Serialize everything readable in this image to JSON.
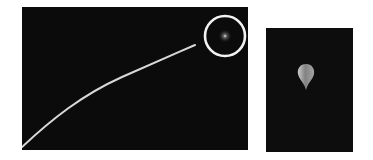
{
  "figure": {
    "main_panel": {
      "description": "Night-sky photo showing a bright curved trajectory streak rising from lower-left toward a circled faint object at upper-right",
      "streak_color": "#d8d8d8",
      "highlight_circle_color": "#f2f2f2",
      "background_color": "#0b0b0b"
    },
    "inset_panel": {
      "description": "Close-up of the circled object, a teardrop/balloon-shaped glowing object",
      "object_color": "#bfbfbf",
      "background_color": "#0d0d0d"
    }
  }
}
